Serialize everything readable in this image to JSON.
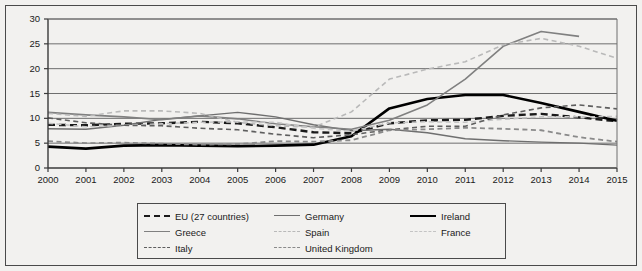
{
  "chart_data": {
    "type": "line",
    "title": "",
    "subtitle": "",
    "xlabel": "",
    "ylabel": "",
    "xlim": [
      2000,
      2015
    ],
    "ylim": [
      0,
      30
    ],
    "y_ticks": [
      0,
      5,
      10,
      15,
      20,
      25,
      30
    ],
    "grid": "horizontal",
    "legend_position": "bottom",
    "categories": [
      "2000",
      "2001",
      "2002",
      "2003",
      "2004",
      "2005",
      "2006",
      "2007",
      "2008",
      "2009",
      "2010",
      "2011",
      "2012",
      "2013",
      "2014",
      "2015"
    ],
    "x": [
      2000,
      2001,
      2002,
      2003,
      2004,
      2005,
      2006,
      2007,
      2008,
      2009,
      2010,
      2011,
      2012,
      2013,
      2014,
      2015
    ],
    "series": [
      {
        "name": "EU (27 countries)",
        "color": "#1a1a1a",
        "style": "dashed",
        "width": 2.4,
        "values": [
          8.7,
          8.6,
          8.9,
          9.0,
          9.3,
          9.0,
          8.2,
          7.2,
          7.0,
          9.0,
          9.6,
          9.7,
          10.5,
          10.9,
          10.2,
          9.4
        ]
      },
      {
        "name": "Germany",
        "color": "#6f6f6f",
        "style": "solid",
        "width": 1.4,
        "values": [
          7.9,
          7.8,
          8.6,
          9.8,
          10.5,
          11.2,
          10.3,
          8.7,
          7.5,
          7.8,
          7.1,
          5.9,
          5.5,
          5.2,
          5.0,
          4.6
        ]
      },
      {
        "name": "Ireland",
        "color": "#000000",
        "style": "solid",
        "width": 2.6,
        "values": [
          4.3,
          3.9,
          4.5,
          4.6,
          4.5,
          4.4,
          4.5,
          4.7,
          6.4,
          12.0,
          13.9,
          14.7,
          14.7,
          13.1,
          11.3,
          9.5
        ]
      },
      {
        "name": "Greece",
        "color": "#808080",
        "style": "solid",
        "width": 1.6,
        "values": [
          11.2,
          10.7,
          10.3,
          9.7,
          10.5,
          9.9,
          8.9,
          8.3,
          7.8,
          9.6,
          12.7,
          17.9,
          24.5,
          27.5,
          26.5,
          null
        ]
      },
      {
        "name": "Spain",
        "color": "#b9b9b9",
        "style": "dashed",
        "width": 1.6,
        "values": [
          11.0,
          10.4,
          11.5,
          11.5,
          11.0,
          9.2,
          8.5,
          8.2,
          11.3,
          17.9,
          19.9,
          21.4,
          24.8,
          26.1,
          24.5,
          22.1
        ]
      },
      {
        "name": "France",
        "color": "#c4c4c4",
        "style": "dashed",
        "width": 1.5,
        "values": [
          9.0,
          8.3,
          8.6,
          8.9,
          9.2,
          9.3,
          9.2,
          8.0,
          7.4,
          9.1,
          9.3,
          9.2,
          9.8,
          10.3,
          10.3,
          10.4
        ]
      },
      {
        "name": "Italy",
        "color": "#5e5e5e",
        "style": "dashed",
        "width": 1.6,
        "values": [
          10.1,
          9.1,
          8.6,
          8.5,
          8.0,
          7.7,
          6.8,
          6.1,
          6.7,
          7.7,
          8.4,
          8.4,
          10.7,
          12.1,
          12.7,
          11.9
        ]
      },
      {
        "name": "United Kingdom",
        "color": "#8a8a8a",
        "style": "dashed",
        "width": 1.8,
        "values": [
          5.4,
          5.0,
          5.1,
          4.9,
          4.7,
          4.8,
          5.4,
          5.3,
          5.6,
          7.6,
          7.8,
          8.1,
          7.9,
          7.6,
          6.2,
          5.3
        ]
      }
    ]
  },
  "legend": {
    "entries": [
      {
        "label": "EU (27 countries)",
        "series": 0
      },
      {
        "label": "Germany",
        "series": 1
      },
      {
        "label": "Ireland",
        "series": 2
      },
      {
        "label": "Greece",
        "series": 3
      },
      {
        "label": "Spain",
        "series": 4
      },
      {
        "label": "France",
        "series": 5
      },
      {
        "label": "Italy",
        "series": 6
      },
      {
        "label": "United Kingdom",
        "series": 7
      }
    ],
    "order": [
      0,
      1,
      2,
      3,
      4,
      5,
      6,
      7,
      null
    ]
  },
  "colors": {
    "background": "#f2f1ef",
    "border": "#4a4a4a",
    "gridline": "#6e6e6e",
    "axis": "#3a3a3a",
    "text": "#1a1a1a"
  }
}
